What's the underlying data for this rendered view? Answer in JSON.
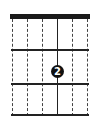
{
  "chord_diagram": {
    "strings": [
      {
        "index": 1,
        "x": 12,
        "style": "dashed"
      },
      {
        "index": 2,
        "x": 27,
        "style": "dashed"
      },
      {
        "index": 3,
        "x": 42,
        "style": "dashed"
      },
      {
        "index": 4,
        "x": 57,
        "style": "solid"
      },
      {
        "index": 5,
        "x": 72,
        "style": "dashed"
      },
      {
        "index": 6,
        "x": 87,
        "style": "dashed"
      }
    ],
    "nut": {
      "visible": true
    },
    "frets": [
      {
        "index": 1,
        "y": 50
      },
      {
        "index": 2,
        "y": 84
      },
      {
        "index": 3,
        "y": 115
      }
    ],
    "finger_dots": [
      {
        "string": 4,
        "fret": 2,
        "finger": "2",
        "color": "#111111",
        "text_color": "#ffffff"
      }
    ]
  }
}
